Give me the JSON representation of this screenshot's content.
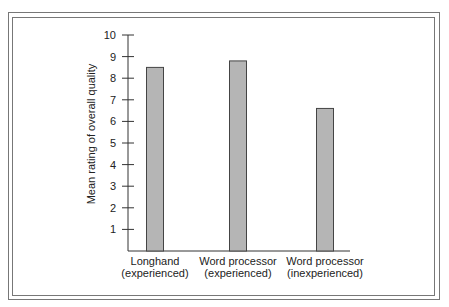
{
  "chart_data": {
    "type": "bar",
    "title": "",
    "xlabel": "",
    "ylabel": "Mean rating of overall quality",
    "categories": [
      [
        "Longhand",
        "(experienced)"
      ],
      [
        "Word processor",
        "(experienced)"
      ],
      [
        "Word processor",
        "(inexperienced)"
      ]
    ],
    "values": [
      8.5,
      8.8,
      6.6
    ],
    "ylim": [
      0,
      10
    ],
    "yticks": [
      1,
      2,
      3,
      4,
      5,
      6,
      7,
      8,
      9,
      10
    ],
    "grid": false,
    "legend": null,
    "bar_color": "#b5b5b5",
    "bar_edge_color": "#444444"
  }
}
